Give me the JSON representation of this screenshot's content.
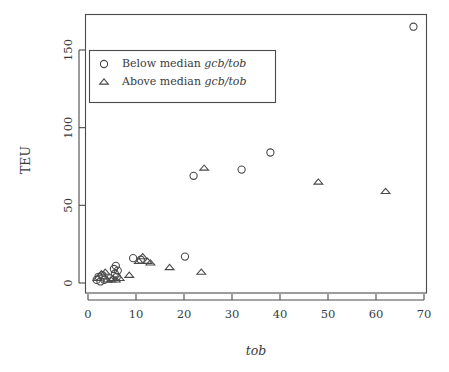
{
  "chart_data": {
    "type": "scatter",
    "title": "",
    "xlabel": "tob",
    "ylabel": "TEU",
    "xlim": [
      0,
      70
    ],
    "ylim": [
      0,
      170
    ],
    "xticks": [
      0,
      10,
      20,
      30,
      40,
      50,
      60,
      70
    ],
    "yticks": [
      0,
      50,
      100,
      150
    ],
    "grid": false,
    "legend_position": "top-left-inside",
    "series": [
      {
        "name": "Below median gcb/tob",
        "marker": "circle",
        "points": [
          [
            1.8,
            2
          ],
          [
            2.2,
            4
          ],
          [
            2.6,
            1
          ],
          [
            3.0,
            5
          ],
          [
            3.4,
            2
          ],
          [
            4.6,
            3
          ],
          [
            5.4,
            9
          ],
          [
            5.6,
            6
          ],
          [
            5.8,
            11
          ],
          [
            6.0,
            4
          ],
          [
            6.2,
            8
          ],
          [
            9.4,
            16
          ],
          [
            11.0,
            15
          ],
          [
            20.2,
            17
          ],
          [
            22.0,
            69
          ],
          [
            32.0,
            73
          ],
          [
            38.0,
            84
          ],
          [
            67.8,
            165
          ]
        ]
      },
      {
        "name": "Above median gcb/tob",
        "marker": "triangle",
        "points": [
          [
            2.0,
            3
          ],
          [
            2.8,
            6
          ],
          [
            3.6,
            7
          ],
          [
            4.0,
            2
          ],
          [
            4.8,
            2
          ],
          [
            5.2,
            3
          ],
          [
            5.8,
            2
          ],
          [
            6.6,
            3
          ],
          [
            8.6,
            5
          ],
          [
            10.6,
            14
          ],
          [
            11.4,
            17
          ],
          [
            12.4,
            14
          ],
          [
            13.0,
            13
          ],
          [
            17.0,
            10
          ],
          [
            23.6,
            7
          ],
          [
            24.2,
            74
          ],
          [
            48.0,
            65
          ],
          [
            62.0,
            59
          ]
        ]
      }
    ]
  },
  "legend": {
    "entries": [
      {
        "marker": "circle",
        "prefix": "Below median ",
        "emphasis": "gcb/tob"
      },
      {
        "marker": "triangle",
        "prefix": "Above median ",
        "emphasis": "gcb/tob"
      }
    ]
  },
  "axes": {
    "x_title": "tob",
    "y_title": "TEU",
    "x_tick_labels": [
      "0",
      "10",
      "20",
      "30",
      "40",
      "50",
      "60",
      "70"
    ],
    "y_tick_labels": [
      "0",
      "50",
      "100",
      "150"
    ]
  },
  "colors": {
    "stroke": "#4a4a4a",
    "text": "#3b3b3b",
    "background": "#ffffff"
  }
}
